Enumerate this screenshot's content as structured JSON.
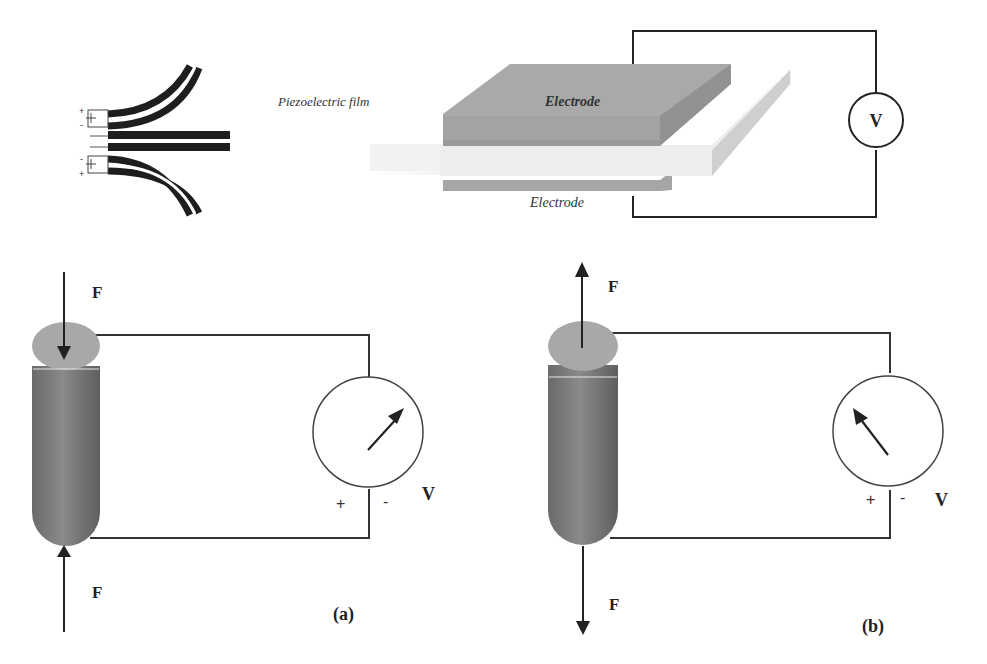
{
  "figure": {
    "top": {
      "bimorph": {
        "description": "Bending piezoelectric bimorph strips (three states)",
        "signs_top": [
          "+",
          "-"
        ],
        "signs_bottom": [
          "-",
          "+"
        ]
      },
      "film": {
        "film_label": "Piezoelectric film",
        "top_electrode_label": "Electrode",
        "bottom_electrode_label": "Electrode",
        "meter_label": "V"
      }
    },
    "panel_a": {
      "caption": "(a)",
      "force_top_label": "F",
      "force_bottom_label": "F",
      "force_direction": "compression",
      "meter_label": "V",
      "plus_sign": "+",
      "minus_sign": "-",
      "needle": "right"
    },
    "panel_b": {
      "caption": "(b)",
      "force_top_label": "F",
      "force_bottom_label": "F",
      "force_direction": "tension",
      "meter_label": "V",
      "plus_sign": "+",
      "minus_sign": "-",
      "needle": "left"
    },
    "colors": {
      "line": "#222222",
      "electrode": "#a8a8a8",
      "electrode_side": "#8f8f8f",
      "film": "#ececec",
      "film_side": "#d0d0d0",
      "cylinder": "#6e6e6e",
      "cylinder_top": "#a9a9a9"
    }
  }
}
